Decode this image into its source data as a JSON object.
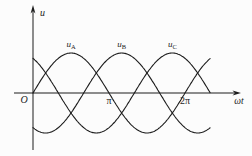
{
  "figure": {
    "background": "#fcfcfc",
    "stroke_color": "#1c1c1c"
  },
  "chart_data": {
    "type": "line",
    "title": "",
    "x_axis": {
      "label": "ωt",
      "origin_label": "O",
      "ticks": [
        {
          "label": "π",
          "value_rad": 3.14159
        },
        {
          "label": "2π",
          "value_rad": 6.28319
        }
      ],
      "range_rad": [
        0,
        7.33
      ],
      "grid": false
    },
    "y_axis": {
      "label": "u",
      "range": [
        -1,
        1
      ],
      "ticks": []
    },
    "legend": "labels-above-peaks",
    "series": [
      {
        "name": "u_A",
        "label_main": "u",
        "label_sub": "A",
        "phase_deg": 0,
        "amplitude": 1
      },
      {
        "name": "u_B",
        "label_main": "u",
        "label_sub": "B",
        "phase_deg": -120,
        "amplitude": 1
      },
      {
        "name": "u_C",
        "label_main": "u",
        "label_sub": "C",
        "phase_deg": 120,
        "amplitude": 1
      }
    ]
  }
}
